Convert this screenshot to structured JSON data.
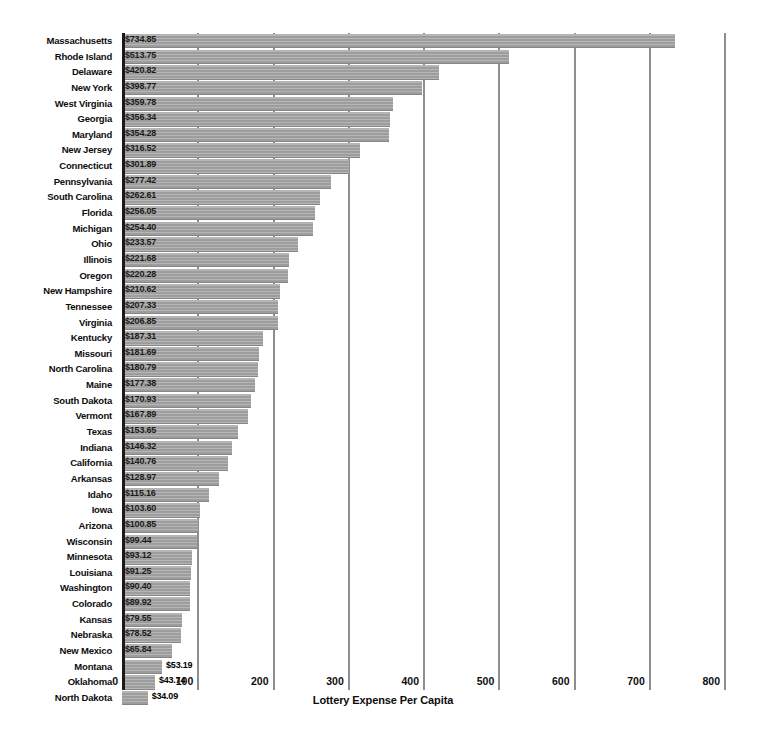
{
  "chart_data": {
    "type": "bar",
    "orientation": "horizontal",
    "title": "",
    "xlabel": "Lottery Expense Per Capita",
    "ylabel": "",
    "xlim": [
      0,
      800
    ],
    "xticks": [
      0,
      100,
      200,
      300,
      400,
      500,
      600,
      700,
      800
    ],
    "xtick_labels": [
      "0",
      "100",
      "200",
      "300",
      "400",
      "500",
      "600",
      "700",
      "800"
    ],
    "grid": true,
    "legend": false,
    "value_prefix": "$",
    "bar_color": "#9d9d9d",
    "axis_color": "#1a1a1a",
    "gridline_color": "#8e8e8e",
    "categories": [
      "Massachusetts",
      "Rhode Island",
      "Delaware",
      "New York",
      "West Virginia",
      "Georgia",
      "Maryland",
      "New Jersey",
      "Connecticut",
      "Pennsylvania",
      "South Carolina",
      "Florida",
      "Michigan",
      "Ohio",
      "Illinois",
      "Oregon",
      "New Hampshire",
      "Tennessee",
      "Virginia",
      "Kentucky",
      "Missouri",
      "North Carolina",
      "Maine",
      "South Dakota",
      "Vermont",
      "Texas",
      "Indiana",
      "California",
      "Arkansas",
      "Idaho",
      "Iowa",
      "Arizona",
      "Wisconsin",
      "Minnesota",
      "Louisiana",
      "Washington",
      "Colorado",
      "Kansas",
      "Nebraska",
      "New Mexico",
      "Montana",
      "Oklahoma",
      "North Dakota"
    ],
    "values": [
      734.85,
      513.75,
      420.82,
      398.77,
      359.78,
      356.34,
      354.28,
      316.52,
      301.89,
      277.42,
      262.61,
      256.05,
      254.4,
      233.57,
      221.68,
      220.28,
      210.62,
      207.33,
      206.85,
      187.31,
      181.69,
      180.79,
      177.38,
      170.93,
      167.89,
      153.65,
      146.32,
      140.76,
      128.97,
      115.16,
      103.6,
      100.85,
      99.44,
      93.12,
      91.25,
      90.4,
      89.92,
      79.55,
      78.52,
      65.84,
      53.19,
      43.74,
      34.09
    ],
    "value_labels": [
      "$734.85",
      "$513.75",
      "$420.82",
      "$398.77",
      "$359.78",
      "$356.34",
      "$354.28",
      "$316.52",
      "$301.89",
      "$277.42",
      "$262.61",
      "$256.05",
      "$254.40",
      "$233.57",
      "$221.68",
      "$220.28",
      "$210.62",
      "$207.33",
      "$206.85",
      "$187.31",
      "$181.69",
      "$180.79",
      "$177.38",
      "$170.93",
      "$167.89",
      "$153.65",
      "$146.32",
      "$140.76",
      "$128.97",
      "$115.16",
      "$103.60",
      "$100.85",
      "$99.44",
      "$93.12",
      "$91.25",
      "$90.40",
      "$89.92",
      "$79.55",
      "$78.52",
      "$65.84",
      "$53.19",
      "$43.74",
      "$34.09"
    ]
  }
}
